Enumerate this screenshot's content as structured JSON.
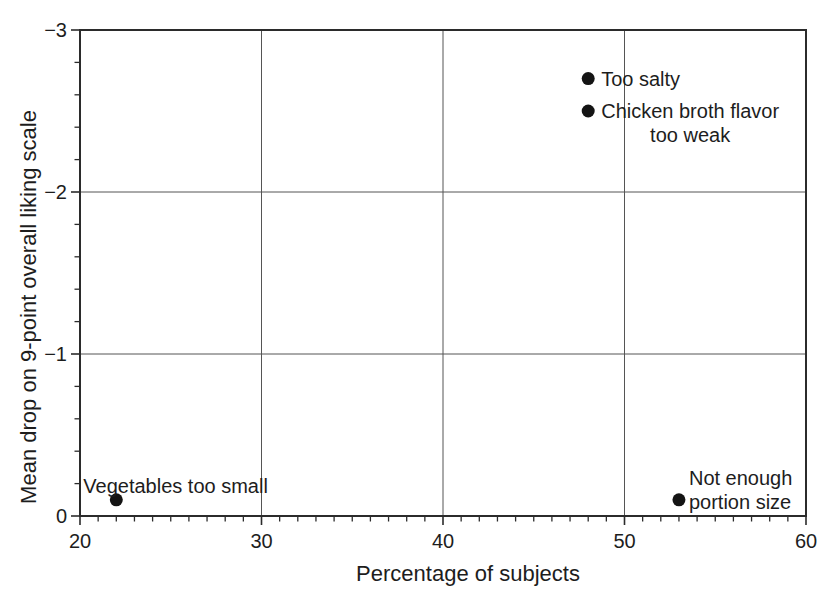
{
  "figure": {
    "background": "#ffffff",
    "text_color": "#1d1d1d",
    "axis_color": "#2b2b2b",
    "grid_color": "#555555",
    "point_color": "#141414"
  },
  "chart_data": {
    "type": "scatter",
    "title": "",
    "xlabel": "Percentage of subjects",
    "ylabel": "Mean drop on 9-point overall liking scale",
    "xlim": [
      20,
      60
    ],
    "ylim": [
      0,
      -3
    ],
    "axis_note": "y-axis inverted: 0 at bottom, -3 at top",
    "grid": true,
    "legend": false,
    "x_gridlines": [
      30,
      40,
      50
    ],
    "y_gridlines": [
      -1,
      -2
    ],
    "x_minor_tick_step": 1,
    "y_minor_tick_step": 0.2,
    "x_ticks": [
      {
        "value": 20,
        "label": "20"
      },
      {
        "value": 30,
        "label": "30"
      },
      {
        "value": 40,
        "label": "40"
      },
      {
        "value": 50,
        "label": "50"
      },
      {
        "value": 60,
        "label": "60"
      }
    ],
    "y_ticks": [
      {
        "value": 0,
        "label": "0"
      },
      {
        "value": -1,
        "label": "−1"
      },
      {
        "value": -2,
        "label": "−2"
      },
      {
        "value": -3,
        "label": "−3"
      }
    ],
    "points": [
      {
        "label": "Too salty",
        "x": 48,
        "y": -2.7,
        "label_lines": [
          "Too salty"
        ],
        "label_dx": 13,
        "label_dy": 0,
        "label_align": "left"
      },
      {
        "label": "Chicken broth flavor too weak",
        "x": 48,
        "y": -2.5,
        "label_lines": [
          "Chicken broth flavor",
          "too weak"
        ],
        "label_dx": 13,
        "label_dy": 12,
        "label_align": "center"
      },
      {
        "label": "Vegetables too small",
        "x": 22,
        "y": -0.1,
        "label_lines": [
          "Vegetables too small"
        ],
        "label_dx": -33,
        "label_dy": -14,
        "label_align": "left"
      },
      {
        "label": "Not enough portion size",
        "x": 53,
        "y": -0.1,
        "label_lines": [
          "Not enough",
          "portion size"
        ],
        "label_dx": 10,
        "label_dy": -10,
        "label_align": "left"
      }
    ]
  }
}
